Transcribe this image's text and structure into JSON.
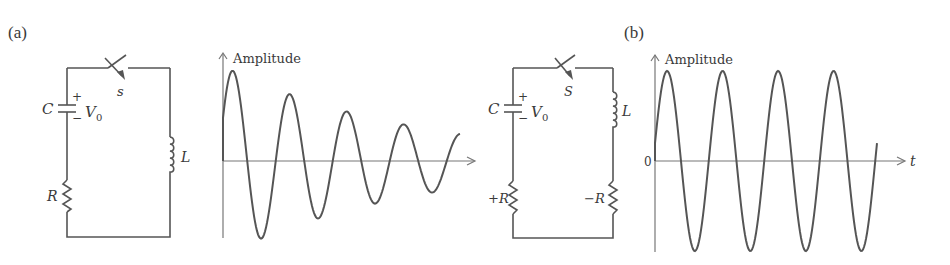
{
  "figure": {
    "panel_a": {
      "label": "(a)",
      "circuit": {
        "capacitor_label": "C",
        "voltage_label": "V",
        "voltage_subscript": "0",
        "plus": "+",
        "minus": "−",
        "switch_label": "s",
        "inductor_label": "L",
        "resistor_label": "R"
      },
      "plot": {
        "y_label": "Amplitude",
        "description": "Damped oscillation"
      }
    },
    "panel_b": {
      "label": "(b)",
      "circuit": {
        "capacitor_label": "C",
        "voltage_label": "V",
        "voltage_subscript": "0",
        "plus": "+",
        "minus": "−",
        "switch_label": "S",
        "inductor_label": "L",
        "pos_resistor_label": "+R",
        "neg_resistor_label": "−R"
      },
      "plot": {
        "y_label": "Amplitude",
        "origin_label": "0",
        "x_label": "t",
        "description": "Sustained (undamped) oscillation"
      }
    }
  },
  "colors": {
    "line": "#555555",
    "axis": "#777777",
    "text": "#3a3a3a"
  }
}
